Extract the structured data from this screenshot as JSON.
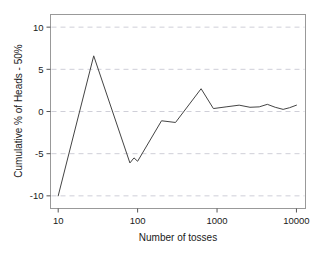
{
  "chart_data": {
    "type": "line",
    "title": "",
    "subtitle": "",
    "xlabel": "Number of tosses",
    "ylabel": "Cumulative % of Heads - 50%",
    "xscale": "log",
    "yscale": "linear",
    "xlim": [
      8.0,
      13000
    ],
    "ylim": [
      -11.5,
      11.5
    ],
    "xticks": [
      10,
      100,
      1000,
      10000
    ],
    "xtick_labels": [
      "10",
      "100",
      "1000",
      "10000"
    ],
    "yticks": [
      10,
      5,
      0,
      -5,
      -10
    ],
    "ytick_labels": [
      "10",
      "5",
      "0",
      "-5",
      "-10"
    ],
    "grid": "horizontal-dashed",
    "legend": "none",
    "line_color": "#444444",
    "grid_color": "#cfcfd8",
    "frame_color": "#999999",
    "background_color": "#ffffff",
    "series": [
      {
        "name": "Cumulative % of Heads - 50%",
        "x": [
          10,
          28,
          80,
          90,
          100,
          200,
          300,
          630,
          900,
          1300,
          1900,
          2600,
          3400,
          4300,
          5400,
          6800,
          8200,
          10000
        ],
        "y": [
          -10.0,
          6.6,
          -6.1,
          -5.5,
          -5.9,
          -1.1,
          -1.3,
          2.7,
          0.35,
          0.55,
          0.75,
          0.5,
          0.55,
          0.85,
          0.5,
          0.25,
          0.45,
          0.75
        ]
      }
    ]
  },
  "axes": {
    "y_axis_title": "Cumulative % of Heads - 50%",
    "x_axis_title": "Number of tosses"
  }
}
